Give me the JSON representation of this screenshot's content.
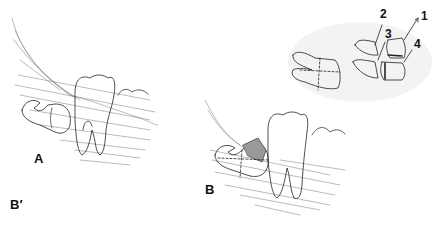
{
  "figure": {
    "panels": [
      {
        "id": "A",
        "label": "A",
        "description": "Impacted lower third molar lying horizontally behind second molar, within bone"
      },
      {
        "id": "B",
        "label": "B",
        "description": "Impacted third molar with crown section (hatched) and dashed sectioning lines"
      },
      {
        "id": "B_prime",
        "label": "B′",
        "description": "Sectioned tooth fragments numbered 1-4"
      }
    ],
    "fragment_numbers": [
      "1",
      "2",
      "3",
      "4"
    ]
  }
}
